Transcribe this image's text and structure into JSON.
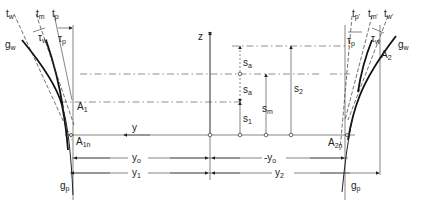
{
  "diagram": {
    "axes": {
      "z": "z",
      "y": "y"
    },
    "left_labels": {
      "t_w": "t",
      "t_w_sub": "w",
      "t_m": "t",
      "t_m_sub": "m",
      "t_p": "t",
      "t_p_sub": "p",
      "tau_w": "τ",
      "tau_w_sub": "w",
      "tau_p": "τ",
      "tau_p_sub": "p",
      "g_w": "g",
      "g_w_sub": "w",
      "A1": "A",
      "A1_sub": "1",
      "A1n": "A",
      "A1n_sub": "1n",
      "g_p": "g",
      "g_p_sub": "p"
    },
    "right_labels": {
      "t_p": "t",
      "t_p_sub": "p'",
      "t_m": "t",
      "t_m_sub": "m'",
      "t_w": "t",
      "t_w_sub": "w'",
      "tau_p": "τ",
      "tau_p_sub": "p",
      "tau_w": "τ",
      "tau_w_sub": "w",
      "g_w": "g",
      "g_w_sub": "w",
      "A2": "A",
      "A2_sub": "2",
      "A2n": "A",
      "A2n_sub": "2n",
      "g_p": "g",
      "g_p_sub": "p"
    },
    "dimensions": {
      "s_a_top": "s",
      "s_a_top_sub": "a",
      "s_a_bot": "s",
      "s_a_bot_sub": "a",
      "s_1": "s",
      "s_1_sub": "1",
      "s_m": "s",
      "s_m_sub": "m",
      "s_2": "s",
      "s_2_sub": "2",
      "y_0_left": "y",
      "y_0_left_sub": "o",
      "y_0_right": "-y",
      "y_0_right_sub": "o",
      "y_1": "y",
      "y_1_sub": "1",
      "y_2": "y",
      "y_2_sub": "2"
    }
  }
}
